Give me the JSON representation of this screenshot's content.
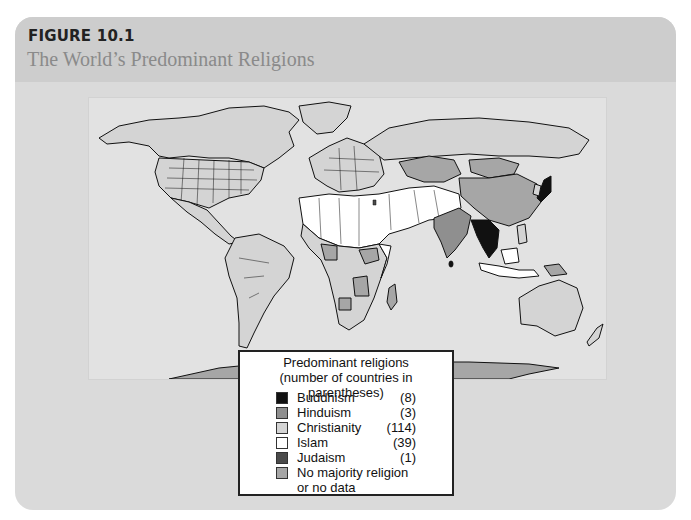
{
  "figure": {
    "label": "FIGURE 10.1",
    "title": "The World’s Predominant Religions"
  },
  "legend": {
    "title_line1": "Predominant religions",
    "title_line2": "(number of countries in parentheses)",
    "items": [
      {
        "name": "Buddhism",
        "count": "(8)",
        "color": "#111111"
      },
      {
        "name": "Hinduism",
        "count": "(3)",
        "color": "#8f8f8f"
      },
      {
        "name": "Christianity",
        "count": "(114)",
        "color": "#d4d4d4"
      },
      {
        "name": "Islam",
        "count": "(39)",
        "color": "#ffffff"
      },
      {
        "name": "Judaism",
        "count": "(1)",
        "color": "#4a4a4a"
      },
      {
        "name": "No majority religion",
        "name2": "or no data",
        "count": "",
        "color": "#a6a6a6"
      }
    ]
  },
  "map": {
    "ocean_color": "#e2e2e2",
    "border_color": "#111111",
    "regions": [
      {
        "region": "North America",
        "religion": "Christianity"
      },
      {
        "region": "South America",
        "religion": "Christianity"
      },
      {
        "region": "Europe",
        "religion": "Christianity"
      },
      {
        "region": "Russia",
        "religion": "Christianity"
      },
      {
        "region": "North Africa & Middle East",
        "religion": "Islam"
      },
      {
        "region": "Central Asia",
        "religion": "Islam"
      },
      {
        "region": "Indonesia",
        "religion": "Islam"
      },
      {
        "region": "India",
        "religion": "Hinduism"
      },
      {
        "region": "Nepal",
        "religion": "Hinduism"
      },
      {
        "region": "Mauritius",
        "religion": "Hinduism"
      },
      {
        "region": "Southeast Asia mainland",
        "religion": "Buddhism"
      },
      {
        "region": "Japan",
        "religion": "Buddhism"
      },
      {
        "region": "Sri Lanka",
        "religion": "Buddhism"
      },
      {
        "region": "Israel",
        "religion": "Judaism"
      },
      {
        "region": "China",
        "religion": "No majority religion or no data"
      },
      {
        "region": "Mongolia / Kazakhstan",
        "religion": "No majority religion or no data"
      },
      {
        "region": "Antarctica",
        "religion": "No majority religion or no data"
      },
      {
        "region": "Australia",
        "religion": "Christianity"
      }
    ]
  }
}
